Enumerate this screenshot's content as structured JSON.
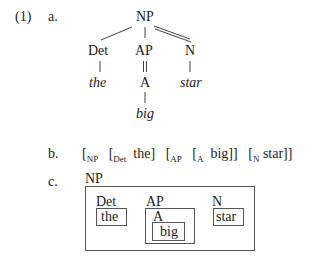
{
  "example": {
    "number": "(1)",
    "a": {
      "label": "a.",
      "tree": {
        "root": "NP",
        "children": [
          {
            "label": "Det",
            "leaf": "the",
            "link": "single"
          },
          {
            "label": "AP",
            "child": "A",
            "leaf": "big",
            "link": "single",
            "ap_to_a": "double"
          },
          {
            "label": "N",
            "leaf": "star",
            "link": "double"
          }
        ]
      }
    },
    "b": {
      "label": "b.",
      "bracketing": [
        {
          "open": "[",
          "sub": "NP",
          "text": ""
        },
        {
          "open": "[",
          "sub": "Det",
          "text": "the]"
        },
        {
          "open": "[",
          "sub": "AP",
          "text": ""
        },
        {
          "open": "[",
          "sub": "A",
          "text": "big]]"
        },
        {
          "open": "[",
          "sub": "N",
          "text": "star]]"
        }
      ]
    },
    "c": {
      "label": "c.",
      "outer_label": "NP",
      "boxes": [
        {
          "label": "Det",
          "content": "the"
        },
        {
          "label": "AP",
          "inner_label": "A",
          "content": "big"
        },
        {
          "label": "N",
          "content": "star"
        }
      ]
    }
  }
}
